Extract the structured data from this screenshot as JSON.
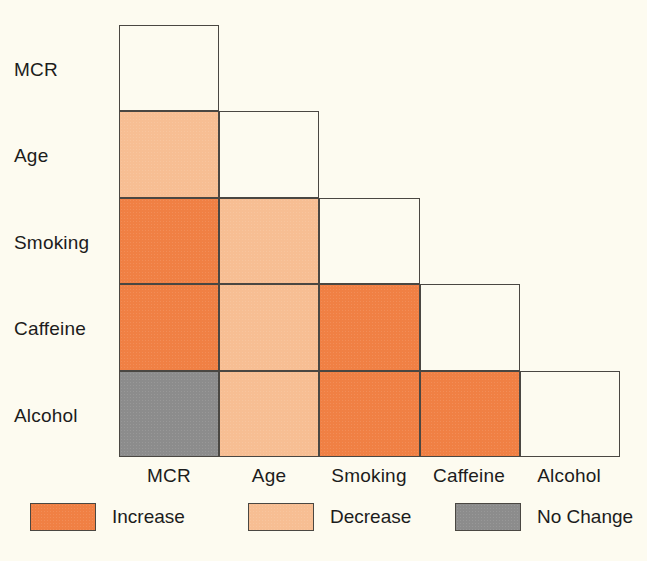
{
  "chart_data": {
    "type": "heatmap",
    "title": "",
    "subtitle": "",
    "xlabel": "",
    "ylabel": "",
    "grid": true,
    "legend_position": "bottom",
    "shape": "lower-triangular",
    "row_categories": [
      "MCR",
      "Age",
      "Smoking",
      "Caffeine",
      "Alcohol"
    ],
    "col_categories": [
      "MCR",
      "Age",
      "Smoking",
      "Caffeine",
      "Alcohol"
    ],
    "category_values": [
      "Increase",
      "Decrease",
      "No Change",
      ""
    ],
    "category_colors": {
      "Increase": "#f08044",
      "Decrease": "#f7be93",
      "No Change": "#8c8c8c",
      "": "#fdfbf0"
    },
    "cells": [
      [
        "",
        null,
        null,
        null,
        null
      ],
      [
        "Decrease",
        "",
        null,
        null,
        null
      ],
      [
        "Increase",
        "Decrease",
        "",
        null,
        null
      ],
      [
        "Increase",
        "Decrease",
        "Increase",
        "",
        null
      ],
      [
        "No Change",
        "Decrease",
        "Increase",
        "Increase",
        ""
      ]
    ]
  },
  "axes": {
    "row_labels": [
      "MCR",
      "Age",
      "Smoking",
      "Caffeine",
      "Alcohol"
    ],
    "col_labels": [
      "MCR",
      "Age",
      "Smoking",
      "Caffeine",
      "Alcohol"
    ]
  },
  "legend": {
    "items": [
      {
        "label": "Increase",
        "color": "#f08044"
      },
      {
        "label": "Decrease",
        "color": "#f7be93"
      },
      {
        "label": "No Change",
        "color": "#8c8c8c"
      }
    ]
  },
  "colors": {
    "background": "#fdfbf0",
    "outline": "#4a4742",
    "text": "#1c1c1c",
    "increase": "#f08044",
    "decrease": "#f7be93",
    "no_change": "#8c8c8c"
  }
}
